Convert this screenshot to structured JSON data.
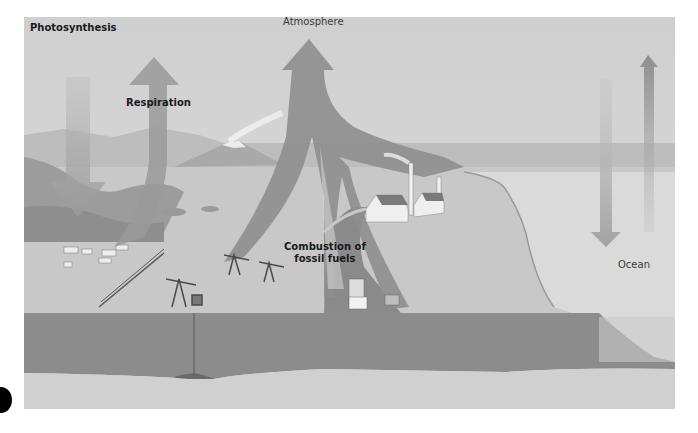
{
  "diagram": {
    "labels": {
      "photosynthesis": "Photosynthesis",
      "respiration": "Respiration",
      "atmosphere": "Atmosphere",
      "combustion_line1": "Combustion of",
      "combustion_line2": "fossil fuels",
      "ocean": "Ocean"
    },
    "arrows": [
      {
        "name": "photosynthesis-arrow",
        "direction": "down",
        "from": "atmosphere",
        "to": "land plants"
      },
      {
        "name": "respiration-arrow",
        "direction": "up",
        "from": "land",
        "to": "atmosphere"
      },
      {
        "name": "combustion-arrow",
        "direction": "up",
        "from": "fossil fuels / industry / vehicles",
        "to": "atmosphere"
      },
      {
        "name": "ocean-uptake-arrow",
        "direction": "down",
        "from": "atmosphere",
        "to": "ocean"
      },
      {
        "name": "ocean-release-arrow",
        "direction": "up",
        "from": "ocean",
        "to": "atmosphere"
      }
    ],
    "scene_elements": [
      "hills",
      "volcano",
      "cattle",
      "fence",
      "oil pumps",
      "factory with smokestacks",
      "road",
      "truck",
      "car",
      "coastline",
      "underground rock layer",
      "fossil fuel deposit"
    ],
    "colors": {
      "sky": "#d8d8d8",
      "arrow": "#8c8c8c",
      "ground": "#c4c4c4",
      "rock": "#8a8a8a",
      "ocean": "#dcdcdc",
      "text": "#1a1a1a"
    }
  }
}
